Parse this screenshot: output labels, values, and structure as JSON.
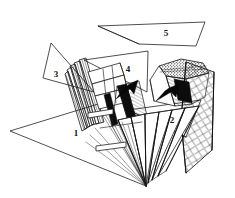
{
  "figure": {
    "background_color": "#ffffff",
    "ink_color": "#141414",
    "width": 235,
    "height": 198,
    "labels": [
      {
        "text": "1",
        "x": 76,
        "y": 133,
        "name": "facet-label-1"
      },
      {
        "text": "2",
        "x": 172,
        "y": 120,
        "name": "facet-label-2"
      },
      {
        "text": "3",
        "x": 56,
        "y": 74,
        "name": "facet-label-3"
      },
      {
        "text": "4",
        "x": 128,
        "y": 69,
        "name": "facet-label-4"
      },
      {
        "text": "5",
        "x": 166,
        "y": 33,
        "name": "facet-label-5"
      }
    ],
    "facets": [
      {
        "name": "facet-triangle-1",
        "label": "1",
        "points": "10,132 121,97 146,186",
        "note": "large lower-left triangle"
      },
      {
        "name": "facet-triangle-2",
        "label": "2",
        "points": "131,108 200,101 186,136",
        "note": "right mid triangle"
      },
      {
        "name": "facet-triangle-3",
        "label": "3",
        "points": "51,44 44,77 93,91",
        "note": "small upper-left triangle"
      },
      {
        "name": "facet-triangle-4",
        "label": "4",
        "points": "83,60 148,52 147,91",
        "note": "upper-middle triangle pointing left"
      },
      {
        "name": "facet-triangle-5",
        "label": "5",
        "points": "98,26 205,22 195,46 139,44",
        "note": "thin elongated top quadrilateral"
      }
    ],
    "arrows": [
      {
        "name": "fold-arrow-left",
        "from_x": 135,
        "from_y": 82,
        "to_x": 114,
        "to_y": 97
      },
      {
        "name": "fold-arrow-right",
        "from_x": 176,
        "from_y": 86,
        "to_x": 155,
        "to_y": 100
      }
    ],
    "regions": [
      {
        "name": "pleated-fan-left",
        "note": "dense stack of thin folded strips, upper-left of center"
      },
      {
        "name": "pleated-fan-bottom",
        "note": "accordion of triangular facets converging to a point at bottom"
      },
      {
        "name": "crosshatch-mesh-right",
        "note": "diamond cross-hatched panel on the right side"
      },
      {
        "name": "shaded-cone-top-right",
        "note": "dark stippled cone-like crumple near top right"
      }
    ]
  }
}
